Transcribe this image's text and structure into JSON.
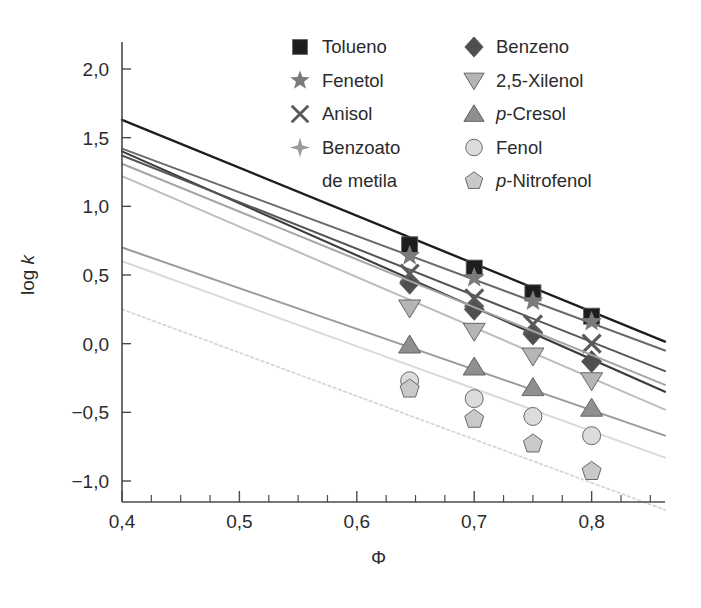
{
  "chart_data": {
    "type": "line",
    "title": "",
    "subtitle": "",
    "xlabel": "Φ",
    "ylabel": "log k",
    "xlim": [
      0.4,
      0.8625
    ],
    "ylim": [
      -1.125,
      2.125
    ],
    "xticks": [
      0.4,
      0.5,
      0.6,
      0.7,
      0.8
    ],
    "xticklabels": [
      "0,4",
      "0,5",
      "0,6",
      "0,7",
      "0,8"
    ],
    "xminorticks": [
      0.425,
      0.45,
      0.475,
      0.525,
      0.55,
      0.575,
      0.625,
      0.65,
      0.675,
      0.725,
      0.75,
      0.775,
      0.825,
      0.85
    ],
    "yticks": [
      2.0,
      1.5,
      1.0,
      0.5,
      0.0,
      -0.5,
      -1.0
    ],
    "yticklabels": [
      "2,0",
      "1,5",
      "1,0",
      "0,5",
      "0,0",
      "−0,5",
      "−1,0"
    ],
    "grid": false,
    "legend_position": "top-center",
    "marker_x": [
      0.645,
      0.7,
      0.75,
      0.8
    ],
    "series": [
      {
        "name": "Tolueno",
        "marker": "square",
        "color": "#1d1d1d",
        "line_color": "#1d1d1d",
        "line_width": 2.4,
        "line_dash": "",
        "x": [
          0.645,
          0.7,
          0.75,
          0.8
        ],
        "values": [
          0.72,
          0.55,
          0.37,
          0.2
        ],
        "fit_start": [
          0.4,
          1.63
        ],
        "fit_end": [
          0.8625,
          0.015
        ]
      },
      {
        "name": "Benzeno",
        "marker": "diamond",
        "color": "#4f4f4f",
        "line_color": "#3c3c3c",
        "line_width": 2.1,
        "line_dash": "",
        "x": [
          0.645,
          0.7,
          0.75,
          0.8
        ],
        "values": [
          0.44,
          0.25,
          0.07,
          -0.13
        ],
        "fit_start": [
          0.4,
          1.4
        ],
        "fit_end": [
          0.8625,
          -0.35
        ]
      },
      {
        "name": "Fenetol",
        "marker": "star5",
        "color": "#7a7a7a",
        "line_color": "#6a6a6a",
        "line_width": 2.0,
        "line_dash": "",
        "x": [
          0.645,
          0.7,
          0.75,
          0.8
        ],
        "values": [
          0.64,
          0.48,
          0.31,
          0.16
        ],
        "fit_start": [
          0.4,
          1.42
        ],
        "fit_end": [
          0.8625,
          -0.05
        ]
      },
      {
        "name": "2,5-Xilenol",
        "marker": "triangle-down",
        "color": "#b5b5b5",
        "line_color": "#bdbdbd",
        "line_width": 2.0,
        "line_dash": "",
        "x": [
          0.645,
          0.7,
          0.75,
          0.8
        ],
        "values": [
          0.26,
          0.09,
          -0.09,
          -0.27
        ],
        "fit_start": [
          0.4,
          1.22
        ],
        "fit_end": [
          0.8625,
          -0.48
        ]
      },
      {
        "name": "Anisol",
        "marker": "cross",
        "color": "#5a5a5a",
        "line_color": "#555555",
        "line_width": 2.0,
        "line_dash": "",
        "x": [
          0.645,
          0.7,
          0.75,
          0.8
        ],
        "values": [
          0.51,
          0.33,
          0.14,
          0.0
        ],
        "fit_start": [
          0.4,
          1.37
        ],
        "fit_end": [
          0.8625,
          -0.2
        ]
      },
      {
        "name": "p-Cresol",
        "marker": "triangle-up",
        "color": "#8f8f8f",
        "line_color": "#9a9a9a",
        "line_width": 2.0,
        "line_dash": "",
        "x": [
          0.645,
          0.7,
          0.75,
          0.8
        ],
        "values": [
          -0.01,
          -0.17,
          -0.32,
          -0.47
        ],
        "fit_start": [
          0.4,
          0.7
        ],
        "fit_end": [
          0.8625,
          -0.67
        ]
      },
      {
        "name": "Benzoato de metila",
        "marker": "star4",
        "color": "#9b9b9b",
        "line_color": "#a5a5a5",
        "line_width": 2.0,
        "line_dash": "",
        "x": [],
        "values": [],
        "fit_start": [
          0.4,
          1.31
        ],
        "fit_end": [
          0.8625,
          -0.3
        ]
      },
      {
        "name": "Fenol",
        "marker": "circle",
        "color": "#dcdcdc",
        "line_color": "#dadada",
        "line_width": 2.0,
        "line_dash": "",
        "x": [
          0.645,
          0.7,
          0.75,
          0.8
        ],
        "values": [
          -0.27,
          -0.4,
          -0.53,
          -0.67
        ],
        "fit_start": [
          0.4,
          0.6
        ],
        "fit_end": [
          0.8625,
          -0.83
        ]
      },
      {
        "name": "p-Nitrofenol",
        "marker": "pentagon",
        "color": "#c9c9c9",
        "line_color": "#d6d6d6",
        "line_width": 1.8,
        "line_dash": "2.5 3",
        "x": [
          0.645,
          0.7,
          0.75,
          0.8
        ],
        "values": [
          -0.33,
          -0.55,
          -0.73,
          -0.93
        ],
        "fit_start": [
          0.4,
          0.25
        ],
        "fit_end": [
          0.8625,
          -1.21
        ]
      }
    ],
    "legend": {
      "columns": [
        [
          {
            "label": "Tolueno",
            "italic_prefix": "",
            "marker": "square",
            "color": "#1d1d1d"
          },
          {
            "label": "Fenetol",
            "italic_prefix": "",
            "marker": "star5",
            "color": "#7a7a7a"
          },
          {
            "label": "Anisol",
            "italic_prefix": "",
            "marker": "cross",
            "color": "#5a5a5a"
          },
          {
            "label": "Benzoato",
            "label2": "de metila",
            "italic_prefix": "",
            "marker": "star4",
            "color": "#9b9b9b"
          }
        ],
        [
          {
            "label": "Benzeno",
            "italic_prefix": "",
            "marker": "diamond",
            "color": "#4f4f4f"
          },
          {
            "label": "2,5-Xilenol",
            "italic_prefix": "",
            "marker": "triangle-down",
            "color": "#b5b5b5"
          },
          {
            "label": "-Cresol",
            "italic_prefix": "p",
            "marker": "triangle-up",
            "color": "#8f8f8f"
          },
          {
            "label": "Fenol",
            "italic_prefix": "",
            "marker": "circle",
            "color": "#dcdcdc"
          },
          {
            "label": "-Nitrofenol",
            "italic_prefix": "p",
            "marker": "pentagon",
            "color": "#c9c9c9"
          }
        ]
      ]
    }
  }
}
